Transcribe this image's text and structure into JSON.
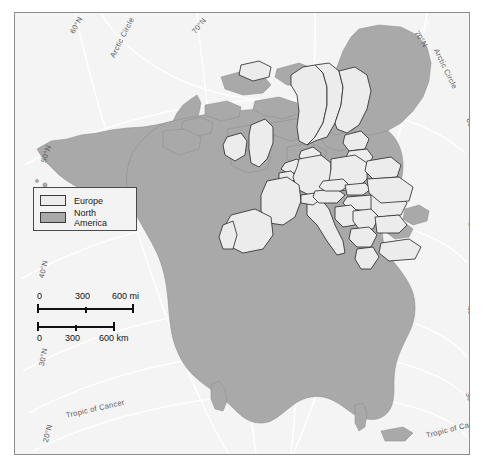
{
  "map": {
    "title": "North America and Europe size comparison map",
    "projection": "conic",
    "background_color": "#f4f4f4",
    "frame_color": "#8d8d8d",
    "north_america_color": "#a9a9a9",
    "europe_color": "#ececec",
    "border_color": "#3a3a3a",
    "graticule_color": "#ffffff"
  },
  "legend": {
    "items": [
      {
        "label": "Europe",
        "color": "#ececec",
        "swatch_name": "europe-swatch"
      },
      {
        "label": "North America",
        "color": "#a9a9a9",
        "swatch_name": "north-america-swatch"
      }
    ]
  },
  "scale": {
    "miles": {
      "unit": "mi",
      "ticks": [
        "0",
        "300",
        "600 mi"
      ],
      "tick_values": [
        0,
        300,
        600
      ]
    },
    "kilometers": {
      "unit": "km",
      "ticks": [
        "0",
        "300",
        "600 km"
      ],
      "tick_values": [
        0,
        300,
        600
      ]
    }
  },
  "graticule_labels": [
    {
      "text": "60°N",
      "x": 53,
      "y": 18,
      "rot": -62
    },
    {
      "text": "70°N",
      "x": 175,
      "y": 17,
      "rot": -52
    },
    {
      "text": "Arctic Circle",
      "x": 93,
      "y": 42,
      "rot": -63
    },
    {
      "text": "70°N",
      "x": 405,
      "y": 16,
      "rot": 57
    },
    {
      "text": "Arctic Circle",
      "x": 425,
      "y": 34,
      "rot": 64
    },
    {
      "text": "50°N",
      "x": 24,
      "y": 148,
      "rot": -72
    },
    {
      "text": "60°N",
      "x": 458,
      "y": 104,
      "rot": 72
    },
    {
      "text": "40°N",
      "x": 22,
      "y": 264,
      "rot": -78
    },
    {
      "text": "50°N",
      "x": 460,
      "y": 208,
      "rot": 76
    },
    {
      "text": "30°N",
      "x": 22,
      "y": 352,
      "rot": -79
    },
    {
      "text": "40°N",
      "x": 459,
      "y": 292,
      "rot": 78
    },
    {
      "text": "Tropic of Cancer",
      "x": 50,
      "y": 398,
      "rot": -13
    },
    {
      "text": "30°N",
      "x": 457,
      "y": 378,
      "rot": 70
    },
    {
      "text": "20°N",
      "x": 26,
      "y": 428,
      "rot": -76
    },
    {
      "text": "Tropic of Cancer",
      "x": 410,
      "y": 418,
      "rot": -14
    }
  ]
}
